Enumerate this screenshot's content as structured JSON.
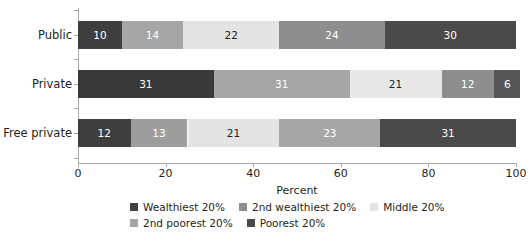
{
  "chart_data": {
    "type": "bar",
    "subtype": "stacked-horizontal-100pct",
    "title": "",
    "xlabel": "Percent",
    "ylabel": "",
    "xlim": [
      0,
      100
    ],
    "xticks": [
      0,
      20,
      40,
      60,
      80,
      100
    ],
    "xtick_labels": [
      "0",
      "20",
      "40",
      "60",
      "80",
      "100"
    ],
    "grid": false,
    "legend_position": "bottom",
    "categories": [
      "Public",
      "Private",
      "Free private"
    ],
    "series": [
      {
        "name": "Wealthiest 20%",
        "values": [
          10,
          31,
          12
        ]
      },
      {
        "name": "2nd wealthiest 20%",
        "values": [
          14,
          31,
          13
        ]
      },
      {
        "name": "Middle 20%",
        "values": [
          22,
          21,
          21
        ]
      },
      {
        "name": "2nd poorest 20%",
        "values": [
          24,
          12,
          23
        ]
      },
      {
        "name": "Poorest 20%",
        "values": [
          30,
          6,
          31
        ]
      }
    ],
    "series_colors": [
      "#3f3f3f",
      "#a6a6a6",
      "#e4e4e4",
      "#8e8e8e",
      "#555555"
    ],
    "series_label_colors": [
      "#ffffff",
      "#ffffff",
      "#231f20",
      "#ffffff",
      "#ffffff"
    ],
    "bars": [
      {
        "category": "Public",
        "segments": [
          {
            "series": "Wealthiest 20%",
            "value": 10,
            "label": "10",
            "color": "#3f3f3f",
            "text_color": "#ffffff"
          },
          {
            "series": "2nd wealthiest 20%",
            "value": 14,
            "label": "14",
            "color": "#a6a6a6",
            "text_color": "#ffffff"
          },
          {
            "series": "Middle 20%",
            "value": 22,
            "label": "22",
            "color": "#e4e4e4",
            "text_color": "#231f20"
          },
          {
            "series": "2nd poorest 20%",
            "value": 24,
            "label": "24",
            "color": "#8e8e8e",
            "text_color": "#ffffff"
          },
          {
            "series": "Poorest 20%",
            "value": 30,
            "label": "30",
            "color": "#4a4a4a",
            "text_color": "#ffffff"
          }
        ]
      },
      {
        "category": "Private",
        "segments": [
          {
            "series": "Wealthiest 20%",
            "value": 31,
            "label": "31",
            "color": "#393939",
            "text_color": "#ffffff"
          },
          {
            "series": "2nd wealthiest 20%",
            "value": 31,
            "label": "31",
            "color": "#a6a6a6",
            "text_color": "#ffffff"
          },
          {
            "series": "Middle 20%",
            "value": 21,
            "label": "21",
            "color": "#e8e8e8",
            "text_color": "#231f20"
          },
          {
            "series": "2nd poorest 20%",
            "value": 12,
            "label": "12",
            "color": "#8e8e8e",
            "text_color": "#ffffff"
          },
          {
            "series": "Poorest 20%",
            "value": 6,
            "label": "6",
            "color": "#555555",
            "text_color": "#ffffff"
          }
        ]
      },
      {
        "category": "Free private",
        "segments": [
          {
            "series": "Wealthiest 20%",
            "value": 12,
            "label": "12",
            "color": "#3f3f3f",
            "text_color": "#ffffff"
          },
          {
            "series": "2nd wealthiest 20%",
            "value": 13,
            "label": "13",
            "color": "#9d9d9d",
            "text_color": "#ffffff"
          },
          {
            "series": "Middle 20%",
            "value": 21,
            "label": "21",
            "color": "#e4e4e4",
            "text_color": "#231f20"
          },
          {
            "series": "2nd poorest 20%",
            "value": 23,
            "label": "23",
            "color": "#a6a6a6",
            "text_color": "#ffffff"
          },
          {
            "series": "Poorest 20%",
            "value": 31,
            "label": "31",
            "color": "#4a4a4a",
            "text_color": "#ffffff"
          }
        ]
      }
    ],
    "legend": [
      {
        "label": "Wealthiest 20%",
        "color": "#3f3f3f"
      },
      {
        "label": "2nd wealthiest 20%",
        "color": "#8e8e8e"
      },
      {
        "label": "Middle 20%",
        "color": "#e4e4e4"
      },
      {
        "label": "2nd poorest 20%",
        "color": "#a6a6a6"
      },
      {
        "label": "Poorest 20%",
        "color": "#4a4a4a"
      }
    ]
  },
  "axis": {
    "x_title": "Percent",
    "tick_labels": [
      "0",
      "20",
      "40",
      "60",
      "80",
      "100"
    ]
  },
  "colors": {
    "axis": "#a7a9ac",
    "text": "#231f20",
    "background": "#ffffff"
  }
}
